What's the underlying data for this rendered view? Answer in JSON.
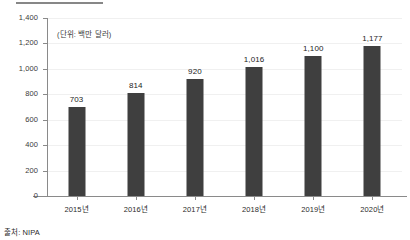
{
  "chart_data": {
    "type": "bar",
    "title": "",
    "subtitle": "",
    "xlabel": "",
    "ylabel": "",
    "unit_note": "(단위: 백만 달러)",
    "source_note": "출처: NIPA",
    "categories": [
      "2015년",
      "2016년",
      "2017년",
      "2018년",
      "2019년",
      "2020년"
    ],
    "values": [
      703,
      814,
      920,
      1016,
      1100,
      1177
    ],
    "value_labels": [
      "703",
      "814",
      "920",
      "1,016",
      "1,100",
      "1,177"
    ],
    "series": [
      {
        "name": "",
        "values": [
          703,
          814,
          920,
          1016,
          1100,
          1177
        ]
      }
    ],
    "ylim": [
      0,
      1400
    ],
    "ytick_values": [
      0,
      200,
      400,
      600,
      800,
      1000,
      1200,
      1400
    ],
    "ytick_labels": [
      "0",
      "200",
      "400",
      "600",
      "800",
      "1,000",
      "1,200",
      "1,400"
    ],
    "grid": true,
    "legend": false,
    "legend_position": "none",
    "bar_color": "#3f3f3f",
    "grid_color": "#f0f0f0",
    "axis_color": "#8a8a8a"
  }
}
